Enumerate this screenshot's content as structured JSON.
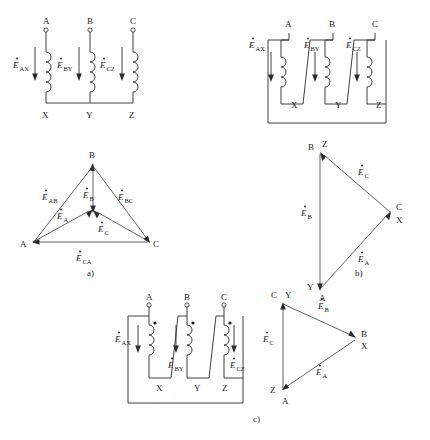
{
  "figure": {
    "captions": {
      "a": "a)",
      "b": "b)",
      "c": "c)"
    }
  },
  "symbols": {
    "E": "E",
    "dot_accent": "̇"
  },
  "circuit_a": {
    "name": "star-connection-circuit",
    "terminals_top": [
      "A",
      "B",
      "C"
    ],
    "terminals_bottom": [
      "X",
      "Y",
      "Z"
    ],
    "emf_labels": [
      {
        "base": "E",
        "sub": "AX"
      },
      {
        "base": "E",
        "sub": "BY"
      },
      {
        "base": "E",
        "sub": "CZ"
      }
    ]
  },
  "phasor_a": {
    "name": "star-phasor-diagram",
    "vertices": [
      "A",
      "B",
      "C"
    ],
    "line_emf_labels": [
      {
        "base": "E",
        "sub": "AB"
      },
      {
        "base": "E",
        "sub": "BC"
      },
      {
        "base": "E",
        "sub": "CA"
      }
    ],
    "phase_emf_labels": [
      {
        "base": "E",
        "sub": "A"
      },
      {
        "base": "E",
        "sub": "B"
      },
      {
        "base": "E",
        "sub": "C"
      }
    ],
    "caption": "a)"
  },
  "circuit_b": {
    "name": "delta-connection-circuit",
    "terminals_top": [
      "A",
      "B",
      "C"
    ],
    "terminals_bottom": [
      "X",
      "Y",
      "Z"
    ],
    "emf_labels": [
      {
        "base": "E",
        "sub": "AX"
      },
      {
        "base": "E",
        "sub": "BY"
      },
      {
        "base": "E",
        "sub": "CZ"
      }
    ]
  },
  "phasor_b": {
    "name": "delta-phasor-diagram",
    "vertex_top": [
      "B",
      "Z"
    ],
    "vertex_right": [
      "C",
      "X"
    ],
    "vertex_bottom": [
      "Y",
      "A"
    ],
    "emf_labels": [
      {
        "base": "E",
        "sub": "A"
      },
      {
        "base": "E",
        "sub": "B"
      },
      {
        "base": "E",
        "sub": "C"
      }
    ],
    "caption": "b)"
  },
  "circuit_c": {
    "name": "reverse-delta-connection-circuit",
    "terminals_top": [
      "A",
      "B",
      "C"
    ],
    "terminals_bottom": [
      "X",
      "Y",
      "Z"
    ],
    "emf_labels": [
      {
        "base": "E",
        "sub": "AX"
      },
      {
        "base": "E",
        "sub": "BY"
      },
      {
        "base": "E",
        "sub": "CZ"
      }
    ],
    "polarity_dots": 3,
    "caption": "c)"
  },
  "phasor_c": {
    "name": "reverse-delta-phasor-diagram",
    "vertex_top": [
      "C",
      "Y"
    ],
    "vertex_right": [
      "B",
      "X"
    ],
    "vertex_bottom": [
      "Z",
      "A"
    ],
    "emf_labels": [
      {
        "base": "E",
        "sub": "A"
      },
      {
        "base": "E",
        "sub": "B"
      },
      {
        "base": "E",
        "sub": "C"
      }
    ]
  },
  "colors": {
    "ink": "#1a1a1a",
    "line": "#2a2a2a",
    "background": "#ffffff"
  }
}
